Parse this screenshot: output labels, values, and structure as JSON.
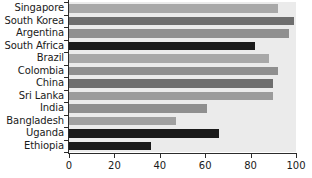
{
  "chart_data": {
    "type": "bar",
    "orientation": "horizontal",
    "title": "",
    "subtitle": "",
    "xlabel": "",
    "ylabel": "",
    "xlim": [
      0,
      100
    ],
    "xticks": [
      0,
      20,
      40,
      60,
      80,
      100
    ],
    "xtick_labels": [
      "0",
      "20",
      "40",
      "60",
      "80",
      "100"
    ],
    "grid": false,
    "legend": false,
    "legend_position": "none",
    "plot_background": "#ebebeb",
    "axis_color": "#2b2b2b",
    "categories": [
      "Singapore",
      "South Korea",
      "Argentina",
      "South Africa",
      "Brazil",
      "Colombia",
      "China",
      "Sri Lanka",
      "India",
      "Bangladesh",
      "Uganda",
      "Ethiopia"
    ],
    "values": [
      92,
      99,
      97,
      82,
      88,
      92,
      90,
      90,
      61,
      47,
      66,
      36
    ],
    "bar_colors": [
      "#a8a8a8",
      "#6e6e6e",
      "#8f8f8f",
      "#1a1a1a",
      "#a8a8a8",
      "#8f8f8f",
      "#6e6e6e",
      "#9b9b9b",
      "#8f8f8f",
      "#a0a0a0",
      "#1a1a1a",
      "#1a1a1a"
    ],
    "bars": [
      {
        "category": "Singapore",
        "value": 92,
        "color": "#a8a8a8"
      },
      {
        "category": "South Korea",
        "value": 99,
        "color": "#6e6e6e"
      },
      {
        "category": "Argentina",
        "value": 97,
        "color": "#8f8f8f"
      },
      {
        "category": "South Africa",
        "value": 82,
        "color": "#1a1a1a"
      },
      {
        "category": "Brazil",
        "value": 88,
        "color": "#a8a8a8"
      },
      {
        "category": "Colombia",
        "value": 92,
        "color": "#8f8f8f"
      },
      {
        "category": "China",
        "value": 90,
        "color": "#6e6e6e"
      },
      {
        "category": "Sri Lanka",
        "value": 90,
        "color": "#9b9b9b"
      },
      {
        "category": "India",
        "value": 61,
        "color": "#8f8f8f"
      },
      {
        "category": "Bangladesh",
        "value": 47,
        "color": "#a0a0a0"
      },
      {
        "category": "Uganda",
        "value": 66,
        "color": "#1a1a1a"
      },
      {
        "category": "Ethiopia",
        "value": 36,
        "color": "#1a1a1a"
      }
    ]
  }
}
